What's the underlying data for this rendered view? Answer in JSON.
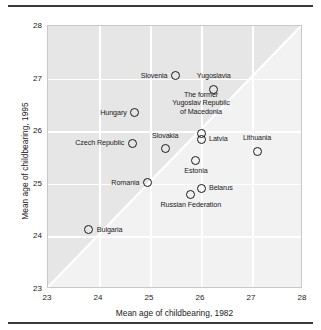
{
  "chart_data": {
    "type": "scatter",
    "title": "",
    "xlabel": "Mean age of childbearing, 1982",
    "ylabel": "Mean age of childbearing, 1995",
    "xlim": [
      23,
      28
    ],
    "ylim": [
      23,
      28
    ],
    "xticks": [
      "23",
      "24",
      "25",
      "26",
      "27",
      "28"
    ],
    "yticks": [
      "23",
      "24",
      "25",
      "26",
      "27",
      "28"
    ],
    "grid": true,
    "legend": "none",
    "annotations": [
      "diagonal y = x reference line"
    ],
    "points": [
      {
        "label": "Slovenia",
        "x": 25.5,
        "y": 27.05,
        "pos": "left"
      },
      {
        "label": "Yugoslavia",
        "x": 26.25,
        "y": 26.8,
        "pos": "above"
      },
      {
        "label": "Hungary",
        "x": 24.7,
        "y": 26.35,
        "pos": "left"
      },
      {
        "label": "The former Yugoslav Republic of Macedonia",
        "x": 26.0,
        "y": 25.95,
        "pos": "block"
      },
      {
        "label": "Latvia",
        "x": 26.0,
        "y": 25.85,
        "pos": "right"
      },
      {
        "label": "Czech Republic",
        "x": 24.65,
        "y": 25.77,
        "pos": "left"
      },
      {
        "label": "Slovakia",
        "x": 25.3,
        "y": 25.67,
        "pos": "above"
      },
      {
        "label": "Lithuania",
        "x": 27.1,
        "y": 25.62,
        "pos": "above"
      },
      {
        "label": "Estonia",
        "x": 25.9,
        "y": 25.45,
        "pos": "below"
      },
      {
        "label": "Romania",
        "x": 24.95,
        "y": 25.02,
        "pos": "left"
      },
      {
        "label": "Belarus",
        "x": 26.0,
        "y": 24.92,
        "pos": "right"
      },
      {
        "label": "Russian Federation",
        "x": 25.8,
        "y": 24.8,
        "pos": "below"
      },
      {
        "label": "Bulgaria",
        "x": 23.8,
        "y": 24.13,
        "pos": "right"
      }
    ]
  }
}
